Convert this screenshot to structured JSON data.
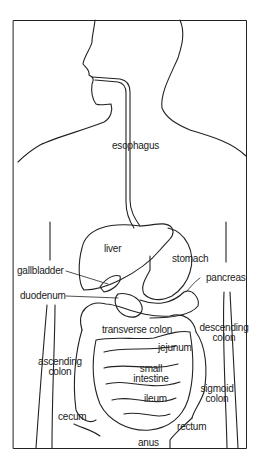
{
  "diagram": {
    "colors": {
      "line": "#222222",
      "background": "#ffffff"
    },
    "labels": {
      "esophagus": "esophagus",
      "liver": "liver",
      "stomach": "stomach",
      "gallbladder": "gallbladder",
      "pancreas": "pancreas",
      "duodenum": "duodenum",
      "transverse_colon": "transverse colon",
      "descending_colon_1": "descending",
      "descending_colon_2": "colon",
      "jejunum": "jejunum",
      "ascending_colon_1": "ascending",
      "ascending_colon_2": "colon",
      "small_intestine_1": "small",
      "small_intestine_2": "intestine",
      "ileum": "ileum",
      "sigmoid_colon_1": "sigmoid",
      "sigmoid_colon_2": "colon",
      "cecum": "cecum",
      "rectum": "rectum",
      "anus": "anus"
    }
  }
}
